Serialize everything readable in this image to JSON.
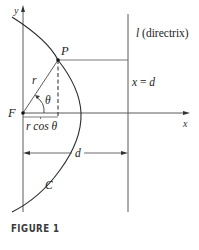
{
  "figure": {
    "caption": "FIGURE 1",
    "labels": {
      "y_axis": "y",
      "x_axis": "x",
      "point_p": "P",
      "focus": "F",
      "radius": "r",
      "angle": "θ",
      "projection": "r cos θ",
      "distance": "d",
      "curve": "C",
      "directrix_name": "l",
      "directrix_suffix": " (directrix)",
      "directrix_eq_lhs": "x",
      "directrix_eq_op": " = ",
      "directrix_eq_rhs": "d"
    },
    "colors": {
      "line": "#4a4a4a",
      "curve": "#2a2a2a",
      "text": "#222222"
    }
  }
}
